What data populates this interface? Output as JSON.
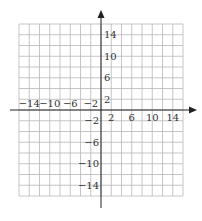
{
  "chart_data": {
    "type": "coordinate-grid",
    "title": "",
    "xlabel": "",
    "ylabel": "",
    "xlim": [
      -16,
      16
    ],
    "ylim": [
      -16,
      16
    ],
    "grid": true,
    "grid_step": 2,
    "x_tick_labels": [
      "−14",
      "−10",
      "−6",
      "−2",
      "2",
      "6",
      "10",
      "14"
    ],
    "x_tick_values": [
      -14,
      -10,
      -6,
      -2,
      2,
      6,
      10,
      14
    ],
    "y_tick_labels": [
      "14",
      "10",
      "6",
      "2",
      "−2",
      "−6",
      "−10",
      "−14"
    ],
    "y_tick_values": [
      14,
      10,
      6,
      2,
      -2,
      -6,
      -10,
      -14
    ],
    "axes_arrows": [
      "positive-x",
      "positive-y"
    ]
  },
  "colors": {
    "grid": "#b8b8b8",
    "axis": "#222222",
    "label": "#333333",
    "background": "#ffffff"
  }
}
